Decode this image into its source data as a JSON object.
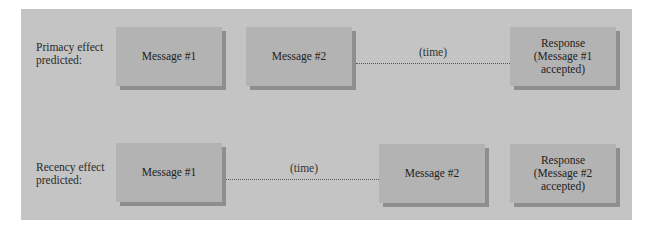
{
  "rows": [
    {
      "label": "Primacy effect\npredicted:",
      "boxes": [
        "Message #1",
        "Message #2",
        "Response\n(Message #1\naccepted)"
      ],
      "time_label": "(time)"
    },
    {
      "label": "Recency effect\npredicted:",
      "boxes": [
        "Message #1",
        "Message #2",
        "Response\n(Message #2\naccepted)"
      ],
      "time_label": "(time)"
    }
  ],
  "colors": {
    "panel": "#c4c4c4",
    "box": "#b3b3b3",
    "box_shadow": "#8e8e8e"
  }
}
